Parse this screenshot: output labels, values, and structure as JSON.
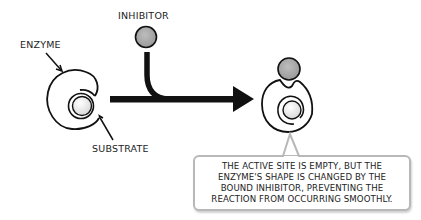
{
  "diagram": {
    "labels": {
      "enzyme": "ENZYME",
      "inhibitor": "INHIBITOR",
      "substrate": "SUBSTRATE"
    },
    "callout": {
      "lines": [
        "THE ACTIVE SITE IS EMPTY, BUT THE",
        "ENZYME'S SHAPE IS CHANGED BY THE",
        "BOUND INHIBITOR, PREVENTING THE",
        "REACTION FROM OCCURRING SMOOTHLY."
      ]
    },
    "colors": {
      "ink": "#111111",
      "inhibitor_fill": "#a9a9a9",
      "substrate_fill": "#f0f0f0",
      "callout_border": "#b8b8b8"
    }
  }
}
